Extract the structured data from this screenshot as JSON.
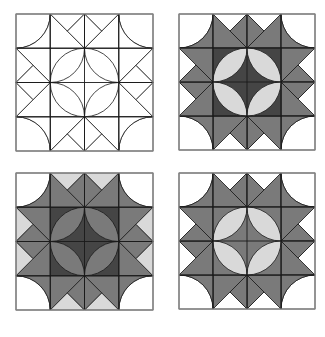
{
  "figure": {
    "colors": {
      "white": "#ffffff",
      "light": "#d9d9d9",
      "medium": "#7a7a7a",
      "dark": "#454545",
      "line": "#1a1a1a",
      "outline": "#8a8a8a"
    },
    "blocks": [
      {
        "id": "block-outline",
        "x": 16,
        "y": 14,
        "size": 137,
        "fills": {
          "corner_outer": "#ffffff",
          "corner_inner": "#ffffff",
          "edge_big": "#ffffff",
          "edge_small": "#ffffff",
          "edge_side": "#ffffff",
          "center_bg": "#ffffff",
          "center_petal": "#ffffff"
        }
      },
      {
        "id": "block-shaded-1",
        "x": 179,
        "y": 14,
        "size": 136,
        "fills": {
          "corner_outer": "#ffffff",
          "corner_inner": "#7a7a7a",
          "edge_big": "#7a7a7a",
          "edge_small": "#ffffff",
          "edge_side": "#7a7a7a",
          "center_bg": "#454545",
          "center_petal": "#d9d9d9"
        }
      },
      {
        "id": "block-shaded-2",
        "x": 16,
        "y": 173,
        "size": 137,
        "fills": {
          "corner_outer": "#ffffff",
          "corner_inner": "#7a7a7a",
          "edge_big": "#7a7a7a",
          "edge_small": "#d9d9d9",
          "edge_side": "#7a7a7a",
          "center_bg": "#454545",
          "center_petal": "#7a7a7a"
        }
      },
      {
        "id": "block-shaded-3",
        "x": 179,
        "y": 173,
        "size": 136,
        "fills": {
          "corner_outer": "#ffffff",
          "corner_inner": "#7a7a7a",
          "edge_big": "#7a7a7a",
          "edge_small": "#ffffff",
          "edge_side": "#7a7a7a",
          "center_bg": "#7a7a7a",
          "center_petal": "#d9d9d9"
        }
      }
    ]
  }
}
